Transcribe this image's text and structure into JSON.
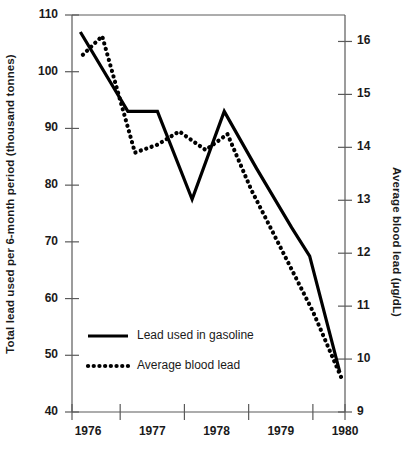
{
  "chart_data": {
    "type": "line",
    "title": "",
    "xlabel": "",
    "ylabel": "Total lead used per 6-month period (thousand tonnes)",
    "y2label": "Average blood lead (µg/dL)",
    "grid": false,
    "legend_position": "inside-lower-left",
    "xlim": [
      1975.75,
      1980.0
    ],
    "ylim": [
      40,
      110
    ],
    "y2lim": [
      9,
      16.5
    ],
    "x_tick_labels": [
      "1976",
      "1977",
      "1978",
      "1979",
      "1980"
    ],
    "x_tick_label_positions": [
      1976.0,
      1977.0,
      1978.0,
      1979.0,
      1980.0
    ],
    "x_tick_mark_positions": [
      1975.75,
      1976.5,
      1977.5,
      1978.5,
      1979.5,
      1980.0
    ],
    "y_tick_labels": [
      "110",
      "100",
      "90",
      "80",
      "70",
      "60",
      "50",
      "40"
    ],
    "y_tick_values": [
      110,
      100,
      90,
      80,
      70,
      60,
      50,
      40
    ],
    "y2_tick_labels": [
      "16",
      "15",
      "14",
      "13",
      "12",
      "11",
      "10",
      "9"
    ],
    "y2_tick_values": [
      16,
      15,
      14,
      13,
      12,
      11,
      10,
      9
    ],
    "series": [
      {
        "name": "Lead used in gasoline",
        "style": "solid",
        "axis": "left",
        "color": "#000000",
        "x": [
          1975.88,
          1976.62,
          1977.08,
          1977.62,
          1978.12,
          1978.62,
          1979.17,
          1979.45,
          1979.92
        ],
        "values": [
          107.0,
          93.0,
          93.0,
          77.5,
          93.0,
          83.0,
          72.5,
          67.5,
          47.0
        ]
      },
      {
        "name": "Average blood lead",
        "style": "dotted",
        "axis": "right",
        "color": "#000000",
        "x": [
          1975.92,
          1976.22,
          1976.73,
          1977.08,
          1977.42,
          1977.83,
          1978.17,
          1978.54,
          1979.0,
          1979.5,
          1979.96
        ],
        "values": [
          15.75,
          16.1,
          13.9,
          14.05,
          14.3,
          13.95,
          14.25,
          13.2,
          12.1,
          10.9,
          9.6
        ]
      }
    ]
  },
  "legend": {
    "entries": [
      {
        "label": "Lead used in gasoline",
        "style": "solid"
      },
      {
        "label": "Average blood lead",
        "style": "dotted"
      }
    ]
  }
}
